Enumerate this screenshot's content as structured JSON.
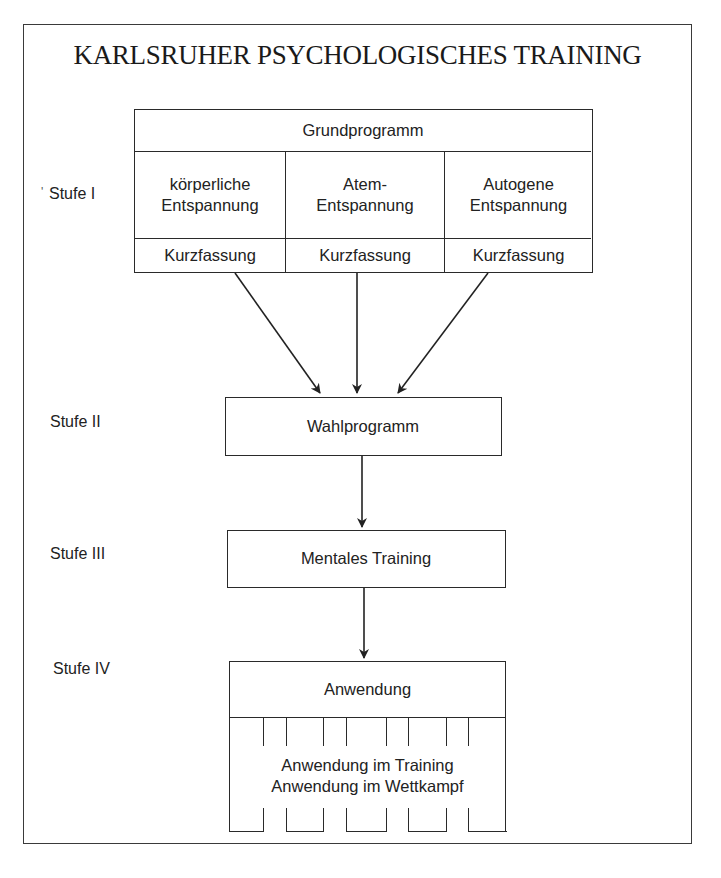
{
  "title": "KARLSRUHER PSYCHOLOGISCHES TRAINING",
  "stages": [
    {
      "label": "Stufe I",
      "marker": "'"
    },
    {
      "label": "Stufe II"
    },
    {
      "label": "Stufe III"
    },
    {
      "label": "Stufe IV"
    }
  ],
  "stage1": {
    "header": "Grundprogramm",
    "columns": [
      {
        "line1": "körperliche",
        "line2": "Entspannung",
        "footer": "Kurzfassung"
      },
      {
        "line1": "Atem-",
        "line2": "Entspannung",
        "footer": "Kurzfassung"
      },
      {
        "line1": "Autogene",
        "line2": "Entspannung",
        "footer": "Kurzfassung"
      }
    ]
  },
  "stage2": {
    "label": "Wahlprogramm"
  },
  "stage3": {
    "label": "Mentales Training"
  },
  "stage4": {
    "header": "Anwendung",
    "line1": "Anwendung im Training",
    "line2": "Anwendung im Wettkampf"
  },
  "colors": {
    "ink": "#222222",
    "background": "#ffffff"
  }
}
